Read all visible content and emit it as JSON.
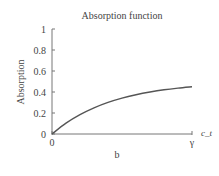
{
  "chart_data": {
    "type": "line",
    "title": "Absorption function",
    "xlabel": "c_t",
    "ylabel": "Absorption",
    "caption": "b",
    "x_tick_labels": [
      "0",
      "γ"
    ],
    "y_ticks": [
      0,
      0.2,
      0.4,
      0.6,
      0.8,
      1
    ],
    "y_tick_labels": [
      "0",
      "0.2",
      "0.4",
      "0.6",
      "0.8",
      "1"
    ],
    "xlim": [
      0,
      1
    ],
    "ylim": [
      0,
      1
    ],
    "grid": false,
    "series": [
      {
        "name": "Absorption",
        "x": [
          0,
          0.1,
          0.2,
          0.3,
          0.4,
          0.5,
          0.6,
          0.7,
          0.8,
          0.9,
          1.0
        ],
        "values": [
          0,
          0.103,
          0.184,
          0.249,
          0.301,
          0.342,
          0.374,
          0.4,
          0.421,
          0.437,
          0.45
        ]
      }
    ],
    "color": "#555555"
  }
}
